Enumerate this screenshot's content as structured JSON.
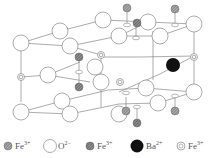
{
  "figure": {
    "colors": {
      "line": "#777777",
      "o2_fill": "#ffffff",
      "ba_fill": "#111111",
      "fe_hatched_fill": "#999999",
      "fe_ring_stroke": "#888888"
    }
  },
  "legend": {
    "items": [
      {
        "symbol": "fe-hatched-light",
        "ion": "Fe",
        "charge": "3+"
      },
      {
        "symbol": "o-open-circle",
        "ion": "O",
        "charge": "2−"
      },
      {
        "symbol": "fe-hatched-dark",
        "ion": "Fe",
        "charge": "3+"
      },
      {
        "symbol": "ba-solid",
        "ion": "Ba",
        "charge": "2+"
      },
      {
        "symbol": "fe-ring",
        "ion": "Fe",
        "charge": "3+"
      }
    ]
  }
}
